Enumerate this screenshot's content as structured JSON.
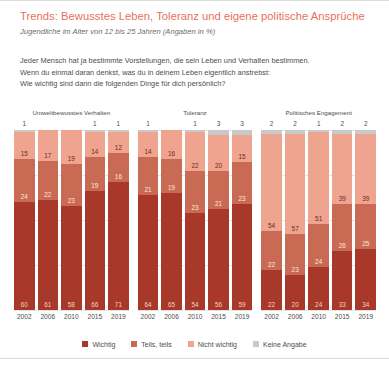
{
  "header": {
    "title": "Trends: Bewusstes Leben, Toleranz und eigene politische Ansprüche",
    "subtitle": "Jugendliche im Alter von 12 bis 25 Jahren (Angaben in %)",
    "title_color": "#e8705a"
  },
  "question": {
    "line1": "Jeder Mensch hat ja bestimmte Vorstellungen, die sein Leben und Verhalten bestimmen.",
    "line2": "Wenn du einmal daran denkst, was du in deinem Leben eigentlich anstrebst:",
    "line3": "Wie wichtig sind dann die folgenden Dinge für dich persönlich?"
  },
  "legend": {
    "items": [
      {
        "label": "Wichtig",
        "color": "#a8392a"
      },
      {
        "label": "Teils, teils",
        "color": "#c96a54"
      },
      {
        "label": "Nicht wichtig",
        "color": "#efa490"
      },
      {
        "label": "Keine Angabe",
        "color": "#c9c9c9"
      }
    ]
  },
  "chart_data": {
    "type": "bar",
    "subtype": "stacked-100-percent",
    "title": "Trends: Bewusstes Leben, Toleranz und eigene politische Ansprüche",
    "subtitle": "Jugendliche im Alter von 12 bis 25 Jahren (Angaben in %)",
    "xlabel": "",
    "ylabel": "",
    "ylim": [
      0,
      100
    ],
    "grid": true,
    "legend_position": "bottom",
    "categories": [
      "2002",
      "2006",
      "2010",
      "2015",
      "2019"
    ],
    "series_order": [
      "Wichtig",
      "Teils, teils",
      "Nicht wichtig",
      "Keine Angabe"
    ],
    "series_colors": [
      "#a8392a",
      "#c96a54",
      "#efa490",
      "#c9c9c9"
    ],
    "panels": [
      {
        "title": "Umweltbewusstes Verhalten",
        "series": [
          {
            "name": "Wichtig",
            "values": [
              60,
              61,
              58,
              66,
              71
            ]
          },
          {
            "name": "Teils, teils",
            "values": [
              24,
              22,
              23,
              19,
              16
            ]
          },
          {
            "name": "Nicht wichtig",
            "values": [
              15,
              17,
              19,
              14,
              12
            ]
          },
          {
            "name": "Keine Angabe",
            "values": [
              1,
              0,
              0,
              1,
              1
            ]
          }
        ]
      },
      {
        "title": "Toleranz",
        "series": [
          {
            "name": "Wichtig",
            "values": [
              64,
              65,
              54,
              56,
              59
            ]
          },
          {
            "name": "Teils, teils",
            "values": [
              21,
              19,
              23,
              21,
              23
            ]
          },
          {
            "name": "Nicht wichtig",
            "values": [
              14,
              16,
              22,
              20,
              15
            ]
          },
          {
            "name": "Keine Angabe",
            "values": [
              1,
              0,
              1,
              3,
              3
            ]
          }
        ]
      },
      {
        "title": "Politisches Engagement",
        "series": [
          {
            "name": "Wichtig",
            "values": [
              22,
              20,
              24,
              33,
              34
            ]
          },
          {
            "name": "Teils, teils",
            "values": [
              22,
              23,
              24,
              26,
              25
            ]
          },
          {
            "name": "Nicht wichtig",
            "values": [
              54,
              57,
              51,
              39,
              39
            ]
          },
          {
            "name": "Keine Angabe",
            "values": [
              2,
              2,
              1,
              2,
              2
            ]
          }
        ]
      }
    ]
  }
}
